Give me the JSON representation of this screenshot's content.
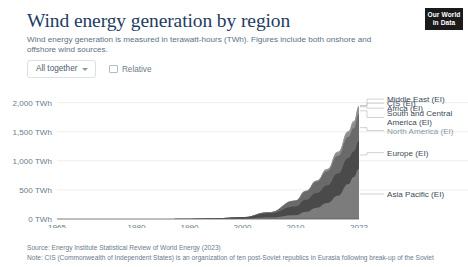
{
  "header": {
    "title": "Wind energy generation by region",
    "subtitle": "Wind energy generation is measured in terawatt-hours (TWh). Figures include both onshore and offshore wind sources."
  },
  "logo": {
    "line1": "Our World",
    "line2": "in Data"
  },
  "controls": {
    "stack_mode_label": "All together",
    "stack_mode_icon": "chevron-down-icon",
    "relative_label": "Relative",
    "relative_checked": false
  },
  "footer": {
    "source": "Source: Energy Institute Statistical Review of World Energy (2023)",
    "note": "Note: CIS (Commonwealth of Independent States) is an organization of ten post-Soviet republics in Eurasia following break-up of the Soviet"
  },
  "chart_data": {
    "type": "area",
    "stacked": true,
    "title": "Wind energy generation by region",
    "xlabel": "",
    "ylabel": "TWh",
    "grid": true,
    "legend_position": "right",
    "xlim": [
      1965,
      2022
    ],
    "ylim": [
      0,
      2200
    ],
    "ytick_labels": [
      "0 TWh",
      "500 TWh",
      "1,000 TWh",
      "1,500 TWh",
      "2,000 TWh"
    ],
    "ytick_values": [
      0,
      500,
      1000,
      1500,
      2000
    ],
    "xtick_labels": [
      "1965",
      "1980",
      "1990",
      "2000",
      "2010",
      "2022"
    ],
    "xtick_values": [
      1965,
      1980,
      1990,
      2000,
      2010,
      2022
    ],
    "x": [
      1965,
      1970,
      1975,
      1980,
      1985,
      1990,
      1995,
      2000,
      2005,
      2010,
      2012,
      2014,
      2016,
      2018,
      2020,
      2021,
      2022
    ],
    "series": [
      {
        "name": "Asia Pacific (EI)",
        "color": "#7c7c7c",
        "label_y_value": 430,
        "values": [
          0,
          0,
          0,
          0,
          0.1,
          0.5,
          2,
          5,
          25,
          65,
          125,
          195,
          275,
          400,
          600,
          720,
          860
        ]
      },
      {
        "name": "Europe (EI)",
        "color": "#4a4a4a",
        "label_y_value": 1140,
        "values": [
          0,
          0,
          0,
          0,
          0.2,
          1,
          6,
          23,
          72,
          150,
          205,
          250,
          300,
          380,
          450,
          440,
          480
        ]
      },
      {
        "name": "North America (EI)",
        "color": "#6a6a6a",
        "label_y_value": 1520,
        "values": [
          0,
          0,
          0,
          0,
          0.3,
          3,
          4,
          6,
          20,
          100,
          145,
          195,
          245,
          305,
          360,
          400,
          460
        ]
      },
      {
        "name": "South and Central America (EI)",
        "color": "#8e8e8e",
        "label_y_value": 1745,
        "values": [
          0,
          0,
          0,
          0,
          0,
          0,
          0,
          0,
          0.5,
          3,
          9,
          17,
          33,
          58,
          83,
          100,
          118
        ]
      },
      {
        "name": "Africa (EI)",
        "color": "#a3a3a3",
        "label_y_value": 1905,
        "values": [
          0,
          0,
          0,
          0,
          0,
          0,
          0,
          0,
          0.2,
          1,
          2,
          4,
          8,
          13,
          17,
          19,
          22
        ]
      },
      {
        "name": "CIS (EI)",
        "color": "#b8b8b8",
        "label_y_value": 1990,
        "values": [
          0,
          0,
          0,
          0,
          0,
          0,
          0,
          0,
          0,
          0.1,
          0.2,
          0.3,
          0.5,
          1,
          3,
          5,
          8
        ]
      },
      {
        "name": "Middle East (EI)",
        "color": "#cdcdcd",
        "label_y_value": 2060,
        "values": [
          0,
          0,
          0,
          0,
          0,
          0,
          0,
          0,
          0,
          0.2,
          0.3,
          0.4,
          0.5,
          0.6,
          0.7,
          0.8,
          1
        ]
      }
    ]
  }
}
